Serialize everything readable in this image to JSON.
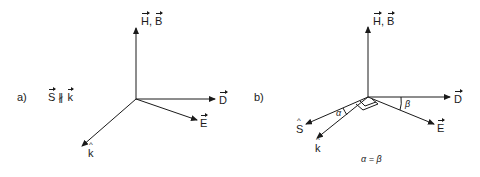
{
  "panel_a": {
    "label": "a)",
    "relation": {
      "left": "S",
      "symbol": "∦",
      "right": "k"
    },
    "vectors": {
      "up": "H, B",
      "up_parts": [
        "H",
        ", ",
        "B"
      ],
      "right": "D",
      "lower_right": "E",
      "lower_left": "k"
    }
  },
  "panel_b": {
    "label": "b)",
    "vectors": {
      "up_parts": [
        "H",
        ", ",
        "B"
      ],
      "right": "D",
      "lower_right": "E",
      "left": "S",
      "lower_left": "k"
    },
    "angles": {
      "alpha": "α",
      "beta": "β"
    },
    "equation": "α = β"
  },
  "colors": {
    "ink": "#1a1a1a",
    "background": "#ffffff"
  }
}
